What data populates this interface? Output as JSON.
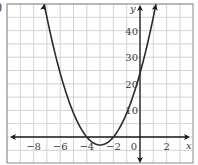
{
  "panel_label": ")",
  "chart_data": {
    "type": "line",
    "title": "",
    "xlabel": "x",
    "ylabel": "y",
    "function": "y = 3x^2 + 18x + 24",
    "xlim": [
      -10,
      3.9
    ],
    "ylim": [
      -10,
      50
    ],
    "x_ticks": [
      -8,
      -6,
      -4,
      -2,
      0,
      2
    ],
    "x_tick_labels": [
      "−8",
      "−6",
      "−4",
      "−2",
      "0",
      "2"
    ],
    "y_ticks": [
      10,
      20,
      30,
      40
    ],
    "y_tick_labels": [
      "10",
      "20",
      "30",
      "40"
    ],
    "grid": true,
    "grid_x_step": 1,
    "grid_y_step": 5,
    "series": [
      {
        "name": "parabola",
        "x": [
          -7.2,
          -7,
          -6,
          -5,
          -4,
          -3.5,
          -3,
          -2.5,
          -2,
          -1,
          0,
          1,
          1.2
        ],
        "y": [
          49.9,
          45,
          24,
          9,
          0,
          -2.25,
          -3,
          -2.25,
          0,
          9,
          24,
          45,
          49.9
        ]
      }
    ],
    "key_points": {
      "vertex": [
        -3,
        -3
      ],
      "x_intercepts": [
        -4,
        -2
      ],
      "y_intercept": 24
    },
    "legend": null
  },
  "colors": {
    "grid": "#c8c8c8",
    "axis": "#1a1a1a",
    "curve": "#2a2a2a",
    "frame": "#8a8a8a"
  }
}
